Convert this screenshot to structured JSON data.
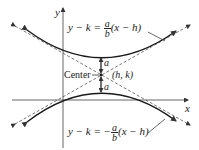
{
  "diagram": {
    "axes": {
      "x_label": "x",
      "y_label": "y"
    },
    "center_label": "Center",
    "center_coords": "(h, k)",
    "semi_axis_label_upper": "a",
    "semi_axis_label_lower": "a",
    "asymptote_upper": {
      "lhs": "y − k = ",
      "num": "a",
      "den": "b",
      "rhs": "(x − h)"
    },
    "asymptote_lower": {
      "lhs": "y − k = −",
      "num": "a",
      "den": "b",
      "rhs": "(x − h)"
    },
    "colors": {
      "curve": "#1a1a1a",
      "asymptote": "#555555",
      "axis": "#444444",
      "text": "#222222"
    }
  }
}
